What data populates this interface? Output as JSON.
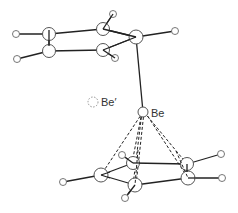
{
  "diagram": {
    "labels": {
      "be": "Be",
      "be_prime": "Be′"
    },
    "atoms": {
      "top_ring": [
        {
          "id": "c1",
          "element": "C",
          "x": 49,
          "y": 34
        },
        {
          "id": "c2",
          "element": "C",
          "x": 49,
          "y": 51
        },
        {
          "id": "c3",
          "element": "C",
          "x": 103,
          "y": 29
        },
        {
          "id": "c4",
          "element": "C",
          "x": 103,
          "y": 50
        },
        {
          "id": "c5",
          "element": "C",
          "x": 136,
          "y": 37
        }
      ],
      "top_hydrogens": [
        {
          "id": "h1",
          "x": 16,
          "y": 34
        },
        {
          "id": "h2",
          "x": 17,
          "y": 59
        },
        {
          "id": "h3",
          "x": 113,
          "y": 14
        },
        {
          "id": "h4",
          "x": 115,
          "y": 58
        },
        {
          "id": "h5",
          "x": 175,
          "y": 31
        }
      ],
      "bottom_ring": [
        {
          "id": "c6",
          "element": "C",
          "x": 101,
          "y": 175
        },
        {
          "id": "c7",
          "element": "C",
          "x": 133,
          "y": 163
        },
        {
          "id": "c8",
          "element": "C",
          "x": 135,
          "y": 185
        },
        {
          "id": "c9",
          "element": "C",
          "x": 187,
          "y": 164
        },
        {
          "id": "c10",
          "element": "C",
          "x": 188,
          "y": 178
        }
      ],
      "bottom_hydrogens": [
        {
          "id": "h6",
          "x": 63,
          "y": 182
        },
        {
          "id": "h7",
          "x": 122,
          "y": 155
        },
        {
          "id": "h8",
          "x": 125,
          "y": 198
        },
        {
          "id": "h9",
          "x": 221,
          "y": 154
        },
        {
          "id": "h10",
          "x": 222,
          "y": 178
        }
      ],
      "be": {
        "x": 143,
        "y": 112
      },
      "be_prime": {
        "x": 93,
        "y": 102
      }
    }
  }
}
